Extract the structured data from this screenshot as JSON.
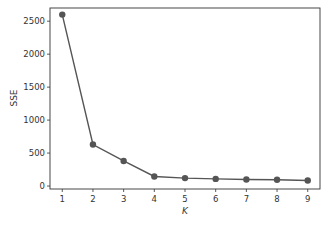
{
  "chart_data": {
    "type": "line",
    "title": "",
    "xlabel": "K",
    "ylabel": "SSE",
    "x": [
      1,
      2,
      3,
      4,
      5,
      6,
      7,
      8,
      9
    ],
    "series": [
      {
        "name": "SSE",
        "values": [
          2600,
          630,
          380,
          145,
          120,
          108,
          98,
          95,
          85
        ]
      }
    ],
    "xticks": [
      "1",
      "2",
      "3",
      "4",
      "5",
      "6",
      "7",
      "8",
      "9"
    ],
    "yticks": [
      "0",
      "500",
      "1000",
      "1500",
      "2000",
      "2500"
    ],
    "ylim": [
      -45,
      2700
    ],
    "xlim": [
      0.6,
      9.4
    ],
    "grid": false,
    "legend": null,
    "line_color": "#555555",
    "marker_color": "#555555"
  }
}
